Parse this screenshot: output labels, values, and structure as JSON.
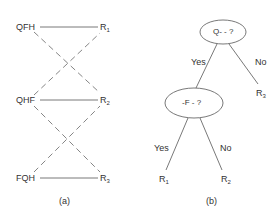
{
  "panel_a": {
    "caption": "(a)",
    "left_nodes": [
      "QFH",
      "QHF",
      "FQH"
    ],
    "right_nodes": [
      {
        "base": "R",
        "sub": "1"
      },
      {
        "base": "R",
        "sub": "2"
      },
      {
        "base": "R",
        "sub": "3"
      }
    ],
    "edges_solid": [
      [
        "QFH",
        "R1"
      ],
      [
        "QHF",
        "R2"
      ],
      [
        "FQH",
        "R3"
      ]
    ],
    "edges_dashed": [
      [
        "QFH",
        "R2"
      ],
      [
        "QHF",
        "R1"
      ],
      [
        "QHF",
        "R3"
      ],
      [
        "FQH",
        "R2"
      ]
    ]
  },
  "panel_b": {
    "caption": "(b)",
    "root_node": "Q- - ?",
    "child_node": "-F - ?",
    "edge_labels": {
      "root_yes": "Yes",
      "root_no": "No",
      "child_yes": "Yes",
      "child_no": "No"
    },
    "leaves": [
      {
        "base": "R",
        "sub": "1"
      },
      {
        "base": "R",
        "sub": "2"
      },
      {
        "base": "R",
        "sub": "3"
      }
    ]
  }
}
